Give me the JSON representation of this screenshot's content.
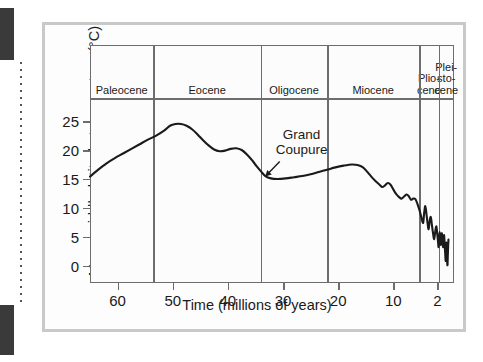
{
  "figure": {
    "y_axis_title": "Mean middle-latitude temperature (°C)",
    "x_axis_title": "Time (millions of years)",
    "annotation_line1": "Grand",
    "annotation_line2": "Coupure",
    "curve_color": "#1a1a1a",
    "frame_color": "#6d6d6d",
    "panel_border_color": "#c9c9c9"
  },
  "chart_data": {
    "type": "line",
    "title": "",
    "xlabel": "Time (millions of years)",
    "ylabel": "Mean middle-latitude temperature (°C)",
    "xlim": [
      65,
      -1
    ],
    "ylim": [
      -3,
      29
    ],
    "x_ticks": [
      60,
      50,
      40,
      30,
      20,
      10,
      2
    ],
    "y_ticks": [
      25,
      20,
      15,
      10,
      5,
      0
    ],
    "x_axis_inverted": true,
    "grid": false,
    "legend": "none",
    "annotations": [
      {
        "text": "Grand Coupure",
        "x": 33.5,
        "y": 15.6,
        "arrow": true,
        "description": "arrow points to temperature drop at Eocene–Oligocene boundary"
      }
    ],
    "epochs": [
      {
        "label": "Paleocene",
        "start": 65,
        "end": 53.5
      },
      {
        "label": "Eocene",
        "start": 53.5,
        "end": 34
      },
      {
        "label": "Oligocene",
        "start": 34,
        "end": 22
      },
      {
        "label": "Miocene",
        "start": 22,
        "end": 5.3
      },
      {
        "label": "Plio-\ncene",
        "start": 5.3,
        "end": 1.8
      },
      {
        "label": "Plei-\nsto-\ncene",
        "start": 1.8,
        "end": -1
      }
    ],
    "series": [
      {
        "name": "Mean middle-latitude temperature",
        "points": [
          [
            65.0,
            15.4
          ],
          [
            63.5,
            16.6
          ],
          [
            62.0,
            17.7
          ],
          [
            60.5,
            18.6
          ],
          [
            59.0,
            19.4
          ],
          [
            57.5,
            20.2
          ],
          [
            56.0,
            21.0
          ],
          [
            54.5,
            21.8
          ],
          [
            53.0,
            22.5
          ],
          [
            51.5,
            23.4
          ],
          [
            50.5,
            24.2
          ],
          [
            49.5,
            24.5
          ],
          [
            48.5,
            24.5
          ],
          [
            47.5,
            24.2
          ],
          [
            46.5,
            23.6
          ],
          [
            45.5,
            22.7
          ],
          [
            44.5,
            21.7
          ],
          [
            43.5,
            20.8
          ],
          [
            42.5,
            20.1
          ],
          [
            41.5,
            19.8
          ],
          [
            40.5,
            19.9
          ],
          [
            39.5,
            20.2
          ],
          [
            38.5,
            20.3
          ],
          [
            37.5,
            20.0
          ],
          [
            36.5,
            19.2
          ],
          [
            35.5,
            18.1
          ],
          [
            34.8,
            17.2
          ],
          [
            34.0,
            16.3
          ],
          [
            33.2,
            15.5
          ],
          [
            32.2,
            15.1
          ],
          [
            31.0,
            15.0
          ],
          [
            29.5,
            15.1
          ],
          [
            28.0,
            15.3
          ],
          [
            26.5,
            15.5
          ],
          [
            25.0,
            15.8
          ],
          [
            23.5,
            16.2
          ],
          [
            22.0,
            16.6
          ],
          [
            20.5,
            17.0
          ],
          [
            19.0,
            17.3
          ],
          [
            17.5,
            17.5
          ],
          [
            16.5,
            17.4
          ],
          [
            15.5,
            17.0
          ],
          [
            14.8,
            16.3
          ],
          [
            14.0,
            15.4
          ],
          [
            13.2,
            14.6
          ],
          [
            12.5,
            14.0
          ],
          [
            12.0,
            13.6
          ],
          [
            11.5,
            13.9
          ],
          [
            11.0,
            14.3
          ],
          [
            10.5,
            14.0
          ],
          [
            10.0,
            13.2
          ],
          [
            9.5,
            12.4
          ],
          [
            9.0,
            11.9
          ],
          [
            8.5,
            11.6
          ],
          [
            8.0,
            12.0
          ],
          [
            7.6,
            12.3
          ],
          [
            7.2,
            12.0
          ],
          [
            6.8,
            11.4
          ],
          [
            6.4,
            11.6
          ],
          [
            6.0,
            11.5
          ],
          [
            5.6,
            10.6
          ],
          [
            5.2,
            9.4
          ],
          [
            4.9,
            8.3
          ],
          [
            4.6,
            7.4
          ],
          [
            4.4,
            9.2
          ],
          [
            4.2,
            10.3
          ],
          [
            4.0,
            9.0
          ],
          [
            3.8,
            7.4
          ],
          [
            3.6,
            6.3
          ],
          [
            3.4,
            7.8
          ],
          [
            3.2,
            8.4
          ],
          [
            3.0,
            7.0
          ],
          [
            2.8,
            5.6
          ],
          [
            2.6,
            4.6
          ],
          [
            2.4,
            5.9
          ],
          [
            2.2,
            6.8
          ],
          [
            2.05,
            5.6
          ],
          [
            1.9,
            4.2
          ],
          [
            1.8,
            3.2
          ],
          [
            1.7,
            4.6
          ],
          [
            1.6,
            5.8
          ],
          [
            1.5,
            4.6
          ],
          [
            1.4,
            3.6
          ],
          [
            1.3,
            4.8
          ],
          [
            1.2,
            5.6
          ],
          [
            1.1,
            4.4
          ],
          [
            1.0,
            3.2
          ],
          [
            0.9,
            4.3
          ],
          [
            0.8,
            5.3
          ],
          [
            0.7,
            3.8
          ],
          [
            0.6,
            2.2
          ],
          [
            0.5,
            0.8
          ],
          [
            0.42,
            2.6
          ],
          [
            0.36,
            4.0
          ],
          [
            0.3,
            2.4
          ],
          [
            0.24,
            0.8
          ],
          [
            0.18,
            0.1
          ],
          [
            0.12,
            1.8
          ],
          [
            0.06,
            3.4
          ],
          [
            0.0,
            4.5
          ]
        ]
      }
    ]
  }
}
